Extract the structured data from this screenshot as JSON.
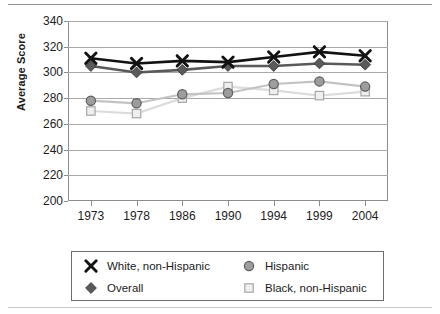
{
  "chart_data": {
    "type": "line",
    "title": "",
    "xlabel": "",
    "ylabel": "Average Score",
    "categories": [
      "1973",
      "1978",
      "1986",
      "1990",
      "1994",
      "1999",
      "2004"
    ],
    "ylim": [
      200,
      340
    ],
    "yticks": [
      200,
      220,
      240,
      260,
      280,
      300,
      320,
      340
    ],
    "grid": true,
    "legend_position": "bottom",
    "series": [
      {
        "name": "White, non-Hispanic",
        "marker": "x",
        "color": "#121212",
        "line_color": "#121212",
        "values": [
          311,
          307,
          309,
          308,
          312,
          316,
          313
        ]
      },
      {
        "name": "Overall",
        "marker": "diamond",
        "color": "#5a5a5a",
        "line_color": "#5a5a5a",
        "values": [
          305,
          300,
          302,
          305,
          305,
          307,
          306
        ]
      },
      {
        "name": "Hispanic",
        "marker": "circle",
        "color": "#9d9d9d",
        "line_color": "#c3c3c3",
        "values": [
          278,
          276,
          283,
          284,
          291,
          293,
          289
        ]
      },
      {
        "name": "Black, non-Hispanic",
        "marker": "square",
        "color": "#dcdcdc",
        "line_color": "#dcdcdc",
        "values": [
          270,
          268,
          280,
          289,
          286,
          282,
          285
        ]
      }
    ]
  },
  "legend": {
    "entries": [
      {
        "label": "White, non-Hispanic",
        "marker": "x-marker-icon"
      },
      {
        "label": "Overall",
        "marker": "diamond-marker-icon"
      },
      {
        "label": "Hispanic",
        "marker": "circle-marker-icon"
      },
      {
        "label": "Black, non-Hispanic",
        "marker": "square-marker-icon"
      }
    ]
  }
}
